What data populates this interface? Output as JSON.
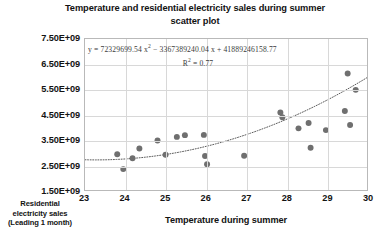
{
  "chart_data": {
    "type": "scatter",
    "title": "Temperature and residential electricity sales during summer scatter plot",
    "title_line1": "Temperature and residential electricity sales during summer",
    "title_line2": "scatter plot",
    "xlabel": "Temperature during summer",
    "ylabel_line1": "Residential",
    "ylabel_line2": "electricity sales",
    "ylabel_line3": "(Leading 1 month)",
    "ylabel": "Residential electricity sales (Leading 1 month)",
    "xlim": [
      23,
      30
    ],
    "ylim": [
      1500000000,
      7500000000
    ],
    "xticks": [
      23,
      24,
      25,
      26,
      27,
      28,
      29,
      30
    ],
    "xtick_labels": [
      "23",
      "24",
      "25",
      "26",
      "27",
      "28",
      "29",
      "30"
    ],
    "yticks": [
      1500000000,
      2500000000,
      3500000000,
      4500000000,
      5500000000,
      6500000000,
      7500000000
    ],
    "ytick_labels": [
      "1.50E+09",
      "2.50E+09",
      "3.50E+09",
      "4.50E+09",
      "5.50E+09",
      "6.50E+09",
      "7.50E+09"
    ],
    "grid": true,
    "legend": "none",
    "marker_color": "#6f6f6f",
    "trendline": {
      "type": "polynomial",
      "order": 2,
      "style": "dotted",
      "color": "#5a5a5a",
      "equation": "y = 72329699.54 x² - 3367389240.04 x + 41889246158.77",
      "equation_a": "72329699.54",
      "equation_b": "-3367389240.04",
      "equation_c": "41889246158.77",
      "r_squared_label": "R² = 0.77",
      "r_squared": 0.77
    },
    "annotations": [
      "y = 72329699.54 x² - 3367389240.04 x + 41889246158.77",
      "R² = 0.77"
    ],
    "points": [
      {
        "x": 23.8,
        "y": 2920000000
      },
      {
        "x": 23.95,
        "y": 2330000000
      },
      {
        "x": 24.18,
        "y": 2760000000
      },
      {
        "x": 24.35,
        "y": 3150000000
      },
      {
        "x": 24.8,
        "y": 3470000000
      },
      {
        "x": 25.0,
        "y": 2900000000
      },
      {
        "x": 25.28,
        "y": 3610000000
      },
      {
        "x": 25.48,
        "y": 3680000000
      },
      {
        "x": 25.95,
        "y": 3690000000
      },
      {
        "x": 25.98,
        "y": 2850000000
      },
      {
        "x": 26.03,
        "y": 2520000000
      },
      {
        "x": 26.95,
        "y": 2860000000
      },
      {
        "x": 27.85,
        "y": 4580000000
      },
      {
        "x": 27.9,
        "y": 4390000000
      },
      {
        "x": 28.3,
        "y": 3950000000
      },
      {
        "x": 28.55,
        "y": 4160000000
      },
      {
        "x": 28.6,
        "y": 3180000000
      },
      {
        "x": 28.98,
        "y": 3880000000
      },
      {
        "x": 29.45,
        "y": 4640000000
      },
      {
        "x": 29.52,
        "y": 6130000000
      },
      {
        "x": 29.58,
        "y": 4080000000
      },
      {
        "x": 29.72,
        "y": 5480000000
      }
    ]
  }
}
